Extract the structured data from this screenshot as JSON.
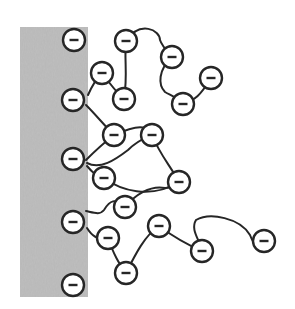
{
  "diagram": {
    "title": "Negatively charged polymer chains grafted to a surface (polyelectrolyte brush)",
    "surface": {
      "x": 20,
      "y": 27,
      "width": 68,
      "height": 270,
      "fill": "#b8b8b8"
    },
    "charge_symbol": "−",
    "bead_radius": 11,
    "bead_stroke": "#262626",
    "chain_stroke": "#262626",
    "anchors": [
      {
        "id": "a1",
        "x": 74,
        "y": 40
      },
      {
        "id": "a2",
        "x": 73,
        "y": 100
      },
      {
        "id": "a3",
        "x": 73,
        "y": 159
      },
      {
        "id": "a4",
        "x": 73,
        "y": 222
      },
      {
        "id": "a5",
        "x": 73,
        "y": 285
      }
    ],
    "beads": [
      {
        "id": "b1",
        "x": 126,
        "y": 41
      },
      {
        "id": "b2",
        "x": 172,
        "y": 57
      },
      {
        "id": "b3",
        "x": 211,
        "y": 78
      },
      {
        "id": "b4",
        "x": 183,
        "y": 104
      },
      {
        "id": "b5",
        "x": 102,
        "y": 73
      },
      {
        "id": "b6",
        "x": 124,
        "y": 99
      },
      {
        "id": "b7",
        "x": 114,
        "y": 135
      },
      {
        "id": "b8",
        "x": 152,
        "y": 135
      },
      {
        "id": "b9",
        "x": 179,
        "y": 182
      },
      {
        "id": "b10",
        "x": 104,
        "y": 178
      },
      {
        "id": "b11",
        "x": 125,
        "y": 207
      },
      {
        "id": "b12",
        "x": 159,
        "y": 226
      },
      {
        "id": "b13",
        "x": 202,
        "y": 251
      },
      {
        "id": "b14",
        "x": 264,
        "y": 241
      },
      {
        "id": "b15",
        "x": 108,
        "y": 238
      },
      {
        "id": "b16",
        "x": 126,
        "y": 273
      }
    ],
    "chains": [
      "M 126 41 C 140 20, 160 30, 160 40 C 162 46, 166 50, 172 57",
      "M 172 57 C 158 70, 158 85, 165 92 C 172 96, 178 98, 183 104",
      "M 183 104 C 195 100, 200 96, 211 78",
      "M 126 41 C 124 60, 128 75, 124 99",
      "M 88 95 C 92 86, 95 80, 102 73",
      "M 102 73 C 110 84, 116 92, 124 99",
      "M 86 105 C 96 115, 104 125, 114 135",
      "M 86 160 C 96 150, 105 142, 114 135",
      "M 114 135 C 125 130, 138 125, 145 128",
      "M 87 163 C 100 170, 115 160, 128 150 C 138 140, 145 138, 152 135",
      "M 152 135 C 160 155, 170 165, 179 182",
      "M 87 166 C 92 172, 96 176, 104 178",
      "M 104 178 C 120 190, 150 200, 179 182",
      "M 86 211 C 95 213, 100 215, 104 210 C 110 200, 115 198, 125 207",
      "M 125 207 C 135 195, 150 185, 165 188 C 170 188, 176 186, 179 182",
      "M 87 228 C 92 236, 97 240, 108 238",
      "M 108 238 C 114 255, 118 262, 126 273",
      "M 126 273 C 135 255, 145 235, 159 226",
      "M 159 226 C 175 238, 188 245, 202 251",
      "M 202 251 C 200 240, 190 230, 196 220 C 210 212, 240 218, 250 235 C 254 245, 256 250, 264 241"
    ]
  }
}
